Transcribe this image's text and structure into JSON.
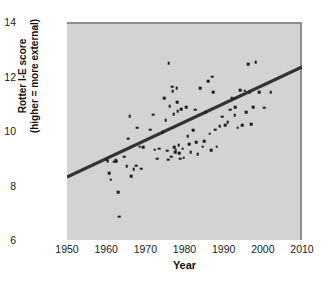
{
  "chart_data": {
    "type": "scatter",
    "title": "",
    "xlabel": "Year",
    "ylabel": "Rotter I-E score (higher = more external)",
    "ylabel_line1": "Rotter I-E score",
    "ylabel_line2": "(higher = more external)",
    "xlim": [
      1950,
      2010
    ],
    "ylim": [
      6,
      14
    ],
    "xticks": [
      1950,
      1960,
      1970,
      1980,
      1990,
      2000,
      2010
    ],
    "yticks": [
      6,
      8,
      10,
      12,
      14
    ],
    "grid": false,
    "legend": null,
    "plot_bgcolor": "#d3d3d3",
    "point_color": "#1c1c1c",
    "line_color": "#333333",
    "trendline": {
      "type": "linear-fit",
      "x": [
        1950,
        2010
      ],
      "y": [
        8.31,
        12.35
      ]
    },
    "points": [
      {
        "x": 1960.0,
        "y": 8.95
      },
      {
        "x": 1960.4,
        "y": 8.9
      },
      {
        "x": 1960.8,
        "y": 8.45
      },
      {
        "x": 1961.2,
        "y": 8.22
      },
      {
        "x": 1962.0,
        "y": 8.88
      },
      {
        "x": 1962.4,
        "y": 8.92
      },
      {
        "x": 1962.6,
        "y": 8.9
      },
      {
        "x": 1963.0,
        "y": 7.75
      },
      {
        "x": 1963.4,
        "y": 6.85
      },
      {
        "x": 1964.6,
        "y": 9.05
      },
      {
        "x": 1965.2,
        "y": 8.7
      },
      {
        "x": 1965.6,
        "y": 9.72
      },
      {
        "x": 1966.0,
        "y": 10.55
      },
      {
        "x": 1966.4,
        "y": 8.35
      },
      {
        "x": 1967.0,
        "y": 8.6
      },
      {
        "x": 1967.6,
        "y": 8.72
      },
      {
        "x": 1967.9,
        "y": 10.12
      },
      {
        "x": 1968.6,
        "y": 9.42
      },
      {
        "x": 1969.0,
        "y": 8.62
      },
      {
        "x": 1969.4,
        "y": 9.4
      },
      {
        "x": 1971.2,
        "y": 10.05
      },
      {
        "x": 1972.0,
        "y": 10.6
      },
      {
        "x": 1972.4,
        "y": 9.32
      },
      {
        "x": 1973.0,
        "y": 8.98
      },
      {
        "x": 1973.6,
        "y": 9.35
      },
      {
        "x": 1974.4,
        "y": 9.95
      },
      {
        "x": 1974.8,
        "y": 11.2
      },
      {
        "x": 1975.2,
        "y": 10.4
      },
      {
        "x": 1975.6,
        "y": 9.28
      },
      {
        "x": 1975.8,
        "y": 8.95
      },
      {
        "x": 1976.0,
        "y": 12.48
      },
      {
        "x": 1976.2,
        "y": 10.92
      },
      {
        "x": 1976.6,
        "y": 9.05
      },
      {
        "x": 1976.9,
        "y": 11.62
      },
      {
        "x": 1977.0,
        "y": 11.45
      },
      {
        "x": 1977.2,
        "y": 10.62
      },
      {
        "x": 1977.4,
        "y": 9.4
      },
      {
        "x": 1977.6,
        "y": 9.22
      },
      {
        "x": 1977.8,
        "y": 9.32
      },
      {
        "x": 1978.0,
        "y": 11.58
      },
      {
        "x": 1978.1,
        "y": 11.05
      },
      {
        "x": 1978.3,
        "y": 10.72
      },
      {
        "x": 1978.5,
        "y": 9.48
      },
      {
        "x": 1978.7,
        "y": 9.18
      },
      {
        "x": 1978.9,
        "y": 8.98
      },
      {
        "x": 1979.2,
        "y": 10.8
      },
      {
        "x": 1979.5,
        "y": 9.35
      },
      {
        "x": 1979.8,
        "y": 9.02
      },
      {
        "x": 1980.4,
        "y": 10.88
      },
      {
        "x": 1980.8,
        "y": 9.8
      },
      {
        "x": 1981.2,
        "y": 9.52
      },
      {
        "x": 1981.6,
        "y": 9.22
      },
      {
        "x": 1982.2,
        "y": 10.02
      },
      {
        "x": 1982.8,
        "y": 10.78
      },
      {
        "x": 1983.0,
        "y": 9.58
      },
      {
        "x": 1983.4,
        "y": 9.15
      },
      {
        "x": 1984.0,
        "y": 11.58
      },
      {
        "x": 1984.6,
        "y": 9.42
      },
      {
        "x": 1985.0,
        "y": 9.62
      },
      {
        "x": 1985.4,
        "y": 10.7
      },
      {
        "x": 1986.0,
        "y": 11.82
      },
      {
        "x": 1986.4,
        "y": 9.9
      },
      {
        "x": 1986.8,
        "y": 9.3
      },
      {
        "x": 1987.0,
        "y": 12.0
      },
      {
        "x": 1987.4,
        "y": 11.42
      },
      {
        "x": 1987.8,
        "y": 10.05
      },
      {
        "x": 1988.2,
        "y": 9.42
      },
      {
        "x": 1989.0,
        "y": 10.18
      },
      {
        "x": 1989.6,
        "y": 10.52
      },
      {
        "x": 1990.4,
        "y": 10.22
      },
      {
        "x": 1991.0,
        "y": 10.32
      },
      {
        "x": 1991.6,
        "y": 10.78
      },
      {
        "x": 1992.0,
        "y": 11.22
      },
      {
        "x": 1992.4,
        "y": 11.18
      },
      {
        "x": 1992.8,
        "y": 10.58
      },
      {
        "x": 1993.0,
        "y": 10.88
      },
      {
        "x": 1993.6,
        "y": 10.12
      },
      {
        "x": 1994.2,
        "y": 11.5
      },
      {
        "x": 1994.8,
        "y": 10.22
      },
      {
        "x": 1995.4,
        "y": 11.48
      },
      {
        "x": 1995.8,
        "y": 10.7
      },
      {
        "x": 1996.2,
        "y": 12.45
      },
      {
        "x": 1996.6,
        "y": 11.42
      },
      {
        "x": 1997.0,
        "y": 10.25
      },
      {
        "x": 1997.6,
        "y": 10.88
      },
      {
        "x": 1998.2,
        "y": 12.52
      },
      {
        "x": 1999.0,
        "y": 11.42
      },
      {
        "x": 2000.4,
        "y": 10.85
      },
      {
        "x": 2002.0,
        "y": 11.42
      }
    ]
  }
}
